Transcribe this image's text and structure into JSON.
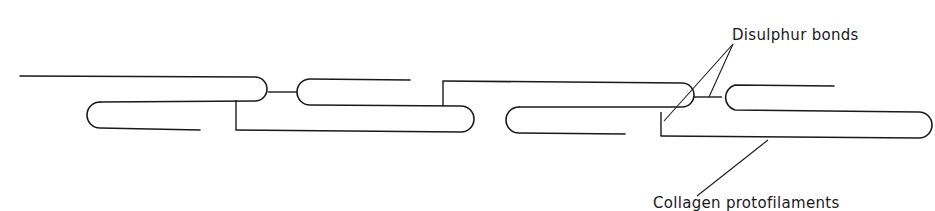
{
  "labels": {
    "disulphur_bonds": "Disulphur bonds",
    "collagen_protofilaments": "Collagen protofilaments"
  },
  "colors": {
    "ink": "#1a1a1a",
    "background": "#ffffff"
  }
}
